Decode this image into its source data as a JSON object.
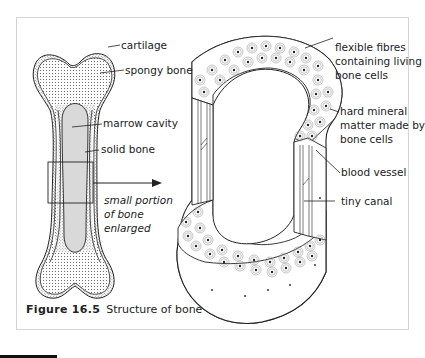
{
  "figure": {
    "number_label": "Figure 16.5",
    "title": "Structure of bone"
  },
  "left_bone": {
    "labels": {
      "cartilage": "cartilage",
      "spongy_bone": "spongy bone",
      "marrow_cavity": "marrow cavity",
      "solid_bone": "solid bone"
    },
    "enlarge_note": [
      "small portion",
      "of bone",
      "enlarged"
    ]
  },
  "enlarged_section": {
    "labels": {
      "flexible_fibres": [
        "flexible fibres",
        "containing living",
        "bone cells"
      ],
      "hard_mineral": [
        "hard mineral",
        "matter made by",
        "bone cells"
      ],
      "blood_vessel": "blood vessel",
      "tiny_canal": "tiny canal"
    }
  },
  "colors": {
    "frame_border": "#d4d4d4",
    "marrow_fill": "#d9d9d9",
    "line": "#222222",
    "spongy_dots": "#555555"
  }
}
